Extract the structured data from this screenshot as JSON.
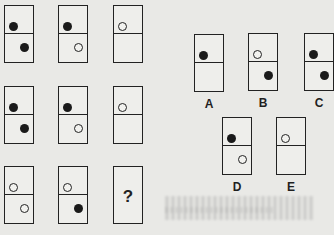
{
  "puzzle": {
    "grid": [
      [
        {
          "top": "black",
          "bottom": "black"
        },
        {
          "top": "black",
          "bottom": "white"
        },
        {
          "top": "white",
          "bottom": "none"
        }
      ],
      [
        {
          "top": "black",
          "bottom": "black"
        },
        {
          "top": "black",
          "bottom": "white"
        },
        {
          "top": "white",
          "bottom": "none"
        }
      ],
      [
        {
          "top": "white",
          "bottom": "white"
        },
        {
          "top": "white",
          "bottom": "black"
        },
        {
          "missing": true,
          "label": "?"
        }
      ]
    ],
    "options": [
      {
        "label": "A",
        "top": "black",
        "bottom": "none"
      },
      {
        "label": "B",
        "top": "white",
        "bottom": "black"
      },
      {
        "label": "C",
        "top": "black",
        "bottom": "black"
      },
      {
        "label": "D",
        "top": "black",
        "bottom": "white"
      },
      {
        "label": "E",
        "top": "white",
        "bottom": "none"
      }
    ]
  },
  "icons": {
    "filled_dot": "black-dot-icon",
    "hollow_dot": "white-dot-icon"
  },
  "colors": {
    "ink": "#222222",
    "paper": "#e9e9e6"
  }
}
